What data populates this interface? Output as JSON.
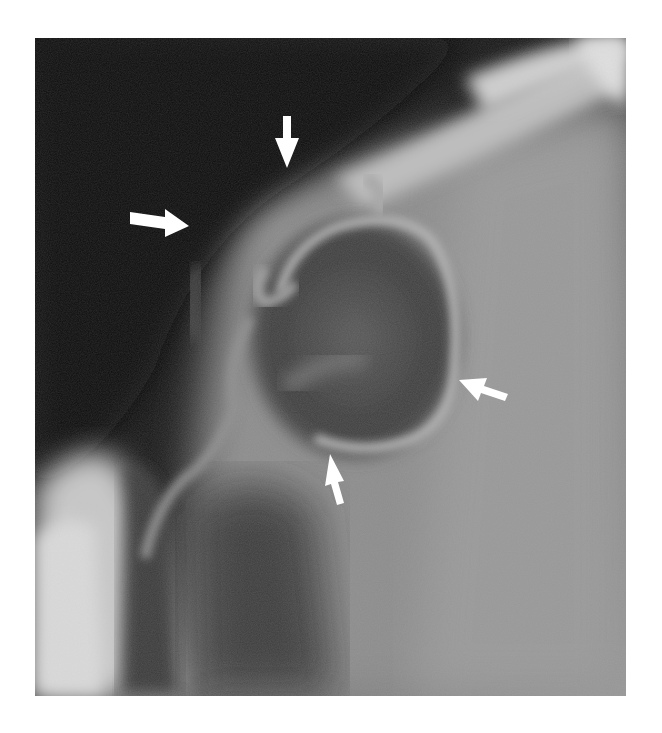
{
  "figure": {
    "type": "radiograph",
    "colors": {
      "background": "#ffffff",
      "dark_region": "#0d0d0d",
      "soft_tissue": "#8a8a8a",
      "bright_band": "#d8d8d8",
      "arrow": "#ffffff"
    },
    "arrows": [
      {
        "id": "top",
        "direction": "down",
        "x": 287,
        "y": 142
      },
      {
        "id": "left",
        "direction": "right",
        "x": 162,
        "y": 222
      },
      {
        "id": "right",
        "direction": "left",
        "x": 478,
        "y": 372
      },
      {
        "id": "bottom",
        "direction": "up",
        "x": 338,
        "y": 475
      }
    ]
  }
}
